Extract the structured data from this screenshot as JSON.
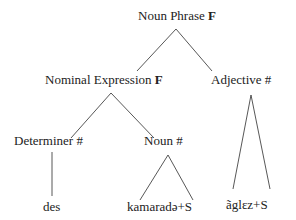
{
  "tree": {
    "root": {
      "label": "Noun Phrase",
      "marker": "F"
    },
    "nominal_expression": {
      "label": "Nominal Expression",
      "marker": "F"
    },
    "adjective": {
      "label": "Adjective",
      "marker": "#"
    },
    "determiner": {
      "label": "Determiner",
      "marker": "#"
    },
    "noun": {
      "label": "Noun",
      "marker": "#"
    },
    "leaves": {
      "determiner": "des",
      "noun": "kamaradə+S",
      "adjective": "ãglɛz+S"
    }
  }
}
